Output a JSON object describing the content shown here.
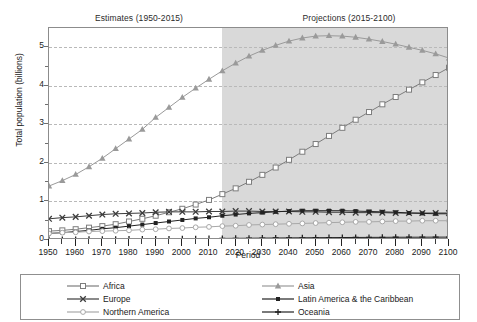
{
  "headers": {
    "estimates": "Estimates (1950-2015)",
    "projections": "Projections (2015-2100)"
  },
  "axes": {
    "ylabel": "Total population (billions)",
    "xlabel": "Period",
    "yticks": [
      "0",
      "1",
      "2",
      "3",
      "4",
      "5"
    ],
    "xticks": [
      "1950",
      "1960",
      "1970",
      "1980",
      "1990",
      "2000",
      "2010",
      "2020",
      "2030",
      "2040",
      "2050",
      "2060",
      "2070",
      "2080",
      "2090",
      "2100"
    ]
  },
  "legend": {
    "items": [
      {
        "label": "Africa",
        "marker": "open-square",
        "color": "#7d7d7d"
      },
      {
        "label": "Asia",
        "marker": "triangle",
        "color": "#9a9a9a"
      },
      {
        "label": "Europe",
        "marker": "x-cross",
        "color": "#3c3c3c"
      },
      {
        "label": "Latin America & the Caribbean",
        "marker": "filled-square",
        "color": "#222222"
      },
      {
        "label": "Northern America",
        "marker": "open-circle",
        "color": "#a8a8a8"
      },
      {
        "label": "Oceania",
        "marker": "plus",
        "color": "#222222"
      }
    ]
  },
  "chart_data": {
    "type": "line",
    "title": "",
    "xlabel": "Period",
    "ylabel": "Total population (billions)",
    "xlim": [
      1950,
      2100
    ],
    "ylim": [
      0,
      5.5
    ],
    "grid": true,
    "legend_position": "bottom",
    "shaded_region": {
      "label": "Projections",
      "from": 2015,
      "to": 2100,
      "color": "#d9d9d9"
    },
    "x": [
      1950,
      1955,
      1960,
      1965,
      1970,
      1975,
      1980,
      1985,
      1990,
      1995,
      2000,
      2005,
      2010,
      2015,
      2020,
      2025,
      2030,
      2035,
      2040,
      2045,
      2050,
      2055,
      2060,
      2065,
      2070,
      2075,
      2080,
      2085,
      2090,
      2095,
      2100
    ],
    "series": [
      {
        "name": "Africa",
        "marker": "open-square",
        "color": "#7d7d7d",
        "values": [
          0.23,
          0.25,
          0.28,
          0.32,
          0.36,
          0.41,
          0.48,
          0.55,
          0.63,
          0.72,
          0.81,
          0.92,
          1.04,
          1.19,
          1.34,
          1.51,
          1.69,
          1.88,
          2.08,
          2.29,
          2.49,
          2.7,
          2.91,
          3.12,
          3.32,
          3.52,
          3.71,
          3.9,
          4.09,
          4.28,
          4.47
        ]
      },
      {
        "name": "Asia",
        "marker": "triangle",
        "color": "#9a9a9a",
        "values": [
          1.4,
          1.54,
          1.7,
          1.9,
          2.12,
          2.37,
          2.62,
          2.87,
          3.18,
          3.44,
          3.7,
          3.94,
          4.17,
          4.39,
          4.59,
          4.77,
          4.92,
          5.05,
          5.16,
          5.24,
          5.29,
          5.3,
          5.29,
          5.26,
          5.21,
          5.15,
          5.08,
          5.0,
          4.92,
          4.83,
          4.72
        ]
      },
      {
        "name": "Europe",
        "marker": "x-cross",
        "color": "#3c3c3c",
        "values": [
          0.55,
          0.58,
          0.6,
          0.63,
          0.66,
          0.68,
          0.69,
          0.7,
          0.72,
          0.73,
          0.73,
          0.73,
          0.74,
          0.74,
          0.75,
          0.75,
          0.74,
          0.74,
          0.74,
          0.73,
          0.73,
          0.72,
          0.72,
          0.71,
          0.71,
          0.71,
          0.7,
          0.7,
          0.7,
          0.7,
          0.7
        ]
      },
      {
        "name": "Latin America & the Caribbean",
        "marker": "filled-square",
        "color": "#222222",
        "values": [
          0.17,
          0.19,
          0.22,
          0.25,
          0.29,
          0.32,
          0.36,
          0.4,
          0.44,
          0.48,
          0.52,
          0.56,
          0.59,
          0.63,
          0.66,
          0.69,
          0.71,
          0.73,
          0.75,
          0.76,
          0.76,
          0.76,
          0.76,
          0.75,
          0.74,
          0.73,
          0.72,
          0.7,
          0.69,
          0.68,
          0.68
        ]
      },
      {
        "name": "Northern America",
        "marker": "open-circle",
        "color": "#a8a8a8",
        "values": [
          0.17,
          0.19,
          0.2,
          0.22,
          0.23,
          0.24,
          0.25,
          0.27,
          0.28,
          0.3,
          0.31,
          0.33,
          0.34,
          0.36,
          0.37,
          0.39,
          0.4,
          0.41,
          0.42,
          0.43,
          0.44,
          0.45,
          0.46,
          0.47,
          0.47,
          0.48,
          0.49,
          0.49,
          0.5,
          0.5,
          0.5
        ]
      },
      {
        "name": "Oceania",
        "marker": "plus",
        "color": "#222222",
        "values": [
          0.013,
          0.015,
          0.016,
          0.018,
          0.02,
          0.021,
          0.023,
          0.025,
          0.027,
          0.029,
          0.031,
          0.033,
          0.036,
          0.04,
          0.043,
          0.046,
          0.049,
          0.052,
          0.055,
          0.057,
          0.06,
          0.062,
          0.064,
          0.066,
          0.068,
          0.069,
          0.071,
          0.072,
          0.073,
          0.074,
          0.075
        ]
      }
    ]
  }
}
